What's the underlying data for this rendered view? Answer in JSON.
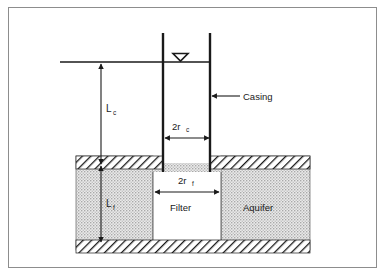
{
  "figure": {
    "type": "technical-cross-section-diagram",
    "border_color": "#8d8d8d",
    "background_color": "#ffffff",
    "line_color": "#1a1a1a",
    "aquifer_fill_color": "#d9d9d9",
    "hatch_color": "#1a1a1a"
  },
  "labels": {
    "casing": "Casing",
    "filter": "Filter",
    "aquifer": "Aquifer",
    "length_casing_main": "L",
    "length_casing_sub": "c",
    "length_filter_main": "L",
    "length_filter_sub": "f",
    "radius_casing_main": "2r",
    "radius_casing_sub": "c",
    "radius_filter_main": "2r",
    "radius_filter_sub": "f"
  },
  "symbols": {
    "water_table": "water-table-triangle"
  },
  "geometry": {
    "water_line_y": 62,
    "casing_top_y": 33,
    "casing_left_x": 163,
    "casing_right_x": 210,
    "aquifer_left_x": 76,
    "aquifer_right_x": 310,
    "aquifer_top_y": 156,
    "aquifer_bottom_y": 250,
    "filter_left_x": 153,
    "filter_right_x": 221,
    "filter_top_y": 172,
    "filter_bottom_y": 240,
    "dim_line_casing_y": 138,
    "dim_line_filter_y": 192,
    "lc_arrow_x": 101,
    "lf_arrow_x": 101
  }
}
